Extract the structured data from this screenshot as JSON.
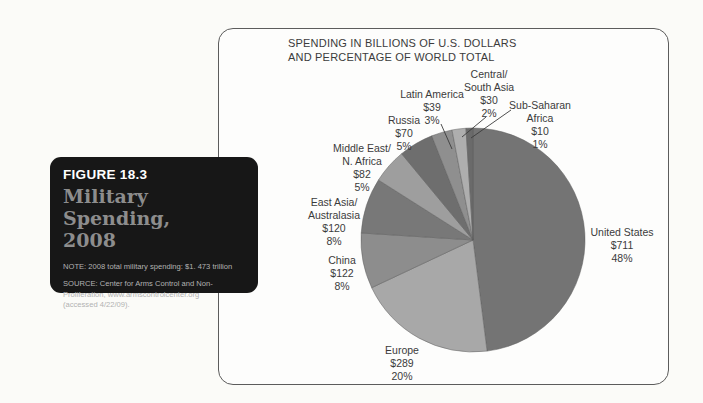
{
  "figure_card": {
    "label": "FIGURE 18.3",
    "title_line1": "Military Spending,",
    "title_line2": "2008",
    "note": "NOTE: 2008 total military spending: $1. 473 trillion",
    "source_line1": "SOURCE: Center for Arms Control and Non-",
    "source_line2": "Proliferation, www.armscontrolcenter.org",
    "source_line3": "(accessed 4/22/09).",
    "background_color": "#171717"
  },
  "chart_panel": {
    "title_line1": "SPENDING IN BILLIONS OF U.S. DOLLARS",
    "title_line2": "AND PERCENTAGE OF WORLD TOTAL"
  },
  "chart_data": {
    "type": "pie",
    "title": "SPENDING IN BILLIONS OF U.S. DOLLARS AND PERCENTAGE OF WORLD TOTAL",
    "units": "billions of U.S. dollars",
    "start_angle_deg": 0,
    "direction": "clockwise",
    "legend_position": "none (direct labels with leader lines)",
    "slices": [
      {
        "label": "United States",
        "amount": "$711",
        "value": 711,
        "percent": 48,
        "color": "#747474",
        "display_lines": [
          "United States",
          "$711",
          "48%"
        ]
      },
      {
        "label": "Europe",
        "amount": "$289",
        "value": 289,
        "percent": 20,
        "color": "#a8a8a8",
        "display_lines": [
          "Europe",
          "$289",
          "20%"
        ]
      },
      {
        "label": "China",
        "amount": "$122",
        "value": 122,
        "percent": 8,
        "color": "#8d8d8d",
        "display_lines": [
          "China",
          "$122",
          "8%"
        ]
      },
      {
        "label": "East Asia/Australasia",
        "amount": "$120",
        "value": 120,
        "percent": 8,
        "color": "#787878",
        "display_lines": [
          "East Asia/",
          "Australasia",
          "$120",
          "8%"
        ]
      },
      {
        "label": "Middle East/N. Africa",
        "amount": "$82",
        "value": 82,
        "percent": 5,
        "color": "#9e9e9e",
        "display_lines": [
          "Middle East/",
          "N. Africa",
          "$82",
          "5%"
        ]
      },
      {
        "label": "Russia",
        "amount": "$70",
        "value": 70,
        "percent": 5,
        "color": "#6e6e6e",
        "display_lines": [
          "Russia",
          "$70",
          "5%"
        ]
      },
      {
        "label": "Latin America",
        "amount": "$39",
        "value": 39,
        "percent": 3,
        "color": "#8f8f8f",
        "display_lines": [
          "Latin America",
          "$39",
          "3%"
        ]
      },
      {
        "label": "Central/South Asia",
        "amount": "$30",
        "value": 30,
        "percent": 2,
        "color": "#aeaeae",
        "display_lines": [
          "Central/",
          "South Asia",
          "$30",
          "2%"
        ]
      },
      {
        "label": "Sub-Saharan Africa",
        "amount": "$10",
        "value": 10,
        "percent": 1,
        "color": "#6a6a6a",
        "display_lines": [
          "Sub-Saharan",
          "Africa",
          "$10",
          "1%"
        ]
      }
    ]
  }
}
